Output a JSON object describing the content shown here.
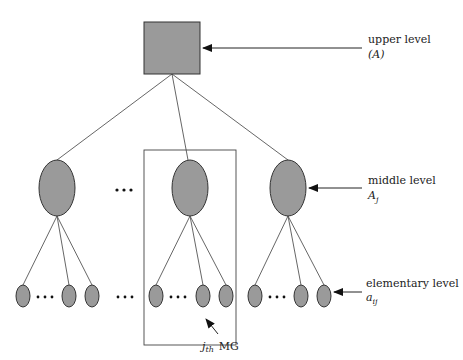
{
  "diagram": {
    "type": "hierarchy-tree",
    "colors": {
      "node_fill": "#9a9a9a",
      "node_stroke": "#333333",
      "edge": "#555555"
    },
    "levels": [
      {
        "id": "upper",
        "label": "upper level",
        "symbol": "(A)",
        "shape": "square"
      },
      {
        "id": "middle",
        "label": "middle level",
        "symbol": "A_j",
        "shape": "ellipse"
      },
      {
        "id": "elementary",
        "label": "elementary level",
        "symbol": "a_ij",
        "shape": "ellipse"
      }
    ],
    "ellipsis": "· · ·",
    "group_box": {
      "label_sub": "j",
      "label_sub2": "th",
      "label_main": "MG"
    }
  },
  "labels": {
    "upper_title": "upper level",
    "upper_symbol": "(A)",
    "middle_title": "middle level",
    "middle_symbol_base": "A",
    "middle_symbol_sub": "j",
    "elem_title": "elementary level",
    "elem_symbol_base": "a",
    "elem_symbol_sub": "ij",
    "mg_j": "j",
    "mg_th": "th",
    "mg_text": "MG",
    "dots": "· · ·"
  }
}
